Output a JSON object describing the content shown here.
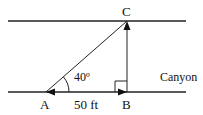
{
  "diagram": {
    "points": {
      "A": {
        "label": "A"
      },
      "B": {
        "label": "B"
      },
      "C": {
        "label": "C"
      }
    },
    "angle_label": "40º",
    "distance_label": "50 ft",
    "region_label": "Canyon",
    "right_angle_at": "B",
    "colors": {
      "stroke": "#111111",
      "background": "#ffffff"
    }
  }
}
